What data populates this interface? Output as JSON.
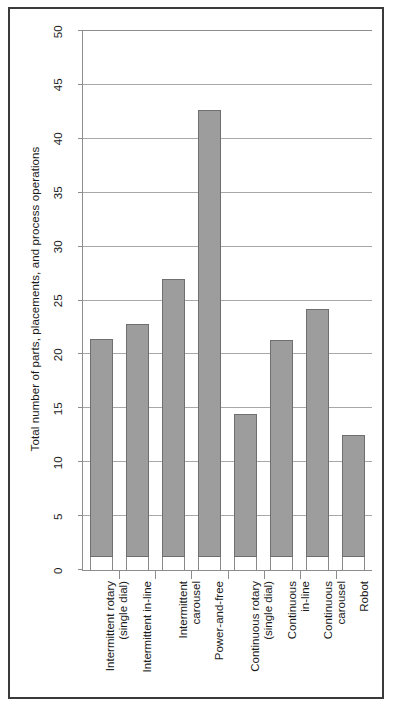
{
  "chart_data": {
    "type": "bar",
    "title": "",
    "xlabel": "",
    "ylabel": "Total number of parts, placements, and process operations",
    "categories": [
      "Intermittent rotary\n(single dial)",
      "Intermittent in-line",
      "Intermittent\ncarousel",
      "Power-and-free",
      "Continuous rotary\n(single dial)",
      "Continuous\nin-line",
      "Continuous\ncarousel",
      "Robot"
    ],
    "values": [
      21.4,
      22.8,
      27.0,
      42.7,
      14.5,
      21.3,
      24.2,
      12.5
    ],
    "bar_base": 1.2,
    "ylim": [
      0,
      50
    ],
    "yticks": [
      0,
      5,
      10,
      15,
      20,
      25,
      30,
      35,
      40,
      45,
      50
    ],
    "ytick_labels": [
      "0",
      "5",
      "10",
      "15",
      "20",
      "25",
      "30",
      "35",
      "40",
      "45",
      "50"
    ],
    "grid": true,
    "grid_axis": "y",
    "legend": "none",
    "bar_color": "#9d9d9d",
    "bar_edge_color": "#6f6f6f",
    "axis_color": "#8d8d8d",
    "grid_color": "#a8a8a8",
    "frame_color": "#3a3a3a",
    "background": "#ffffff"
  }
}
